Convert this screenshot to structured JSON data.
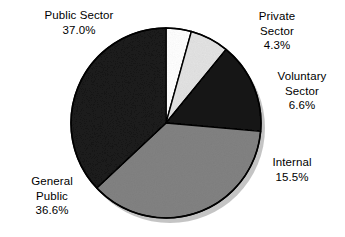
{
  "chart_data": {
    "type": "pie",
    "title": "",
    "subtitle": "",
    "xlabel": "",
    "ylabel": "",
    "legend_position": "none",
    "grid": false,
    "value_suffix": "%",
    "total": 100.0,
    "start_angle_deg": 0,
    "direction": "clockwise",
    "categories": [
      "Private Sector",
      "Voluntary Sector",
      "Internal",
      "General Public",
      "Public Sector"
    ],
    "values": [
      4.3,
      6.6,
      15.5,
      36.6,
      37.0
    ],
    "slices": [
      {
        "label": "Private Sector",
        "label_line1": "Private",
        "label_line2": "Sector",
        "value": 4.3,
        "value_text": "4.3%",
        "color": "#ffffff",
        "stroke": "#000000"
      },
      {
        "label": "Voluntary Sector",
        "label_line1": "Voluntary",
        "label_line2": "Sector",
        "value": 6.6,
        "value_text": "6.6%",
        "color": "#e3e3e3",
        "stroke": "#000000"
      },
      {
        "label": "Internal",
        "label_line1": "Internal",
        "label_line2": "",
        "value": 15.5,
        "value_text": "15.5%",
        "color": "#141414",
        "stroke": "#000000"
      },
      {
        "label": "General Public",
        "label_line1": "General",
        "label_line2": "Public",
        "value": 36.6,
        "value_text": "36.6%",
        "color": "#828282",
        "stroke": "#000000"
      },
      {
        "label": "Public Sector",
        "label_line1": "Public Sector",
        "label_line2": "",
        "value": 37.0,
        "value_text": "37.0%",
        "color": "#1a1a1a",
        "stroke": "#000000"
      }
    ],
    "geometry": {
      "center_x": 166,
      "center_y": 123,
      "radius": 95
    }
  },
  "labels": {
    "public_sector": {
      "name": "Public Sector",
      "value": "37.0%"
    },
    "private_sector": {
      "line1": "Private",
      "line2": "Sector",
      "value": "4.3%"
    },
    "voluntary_sector": {
      "line1": "Voluntary",
      "line2": "Sector",
      "value": "6.6%"
    },
    "internal": {
      "name": "Internal",
      "value": "15.5%"
    },
    "general_public": {
      "line1": "General",
      "line2": "Public",
      "value": "36.6%"
    }
  }
}
